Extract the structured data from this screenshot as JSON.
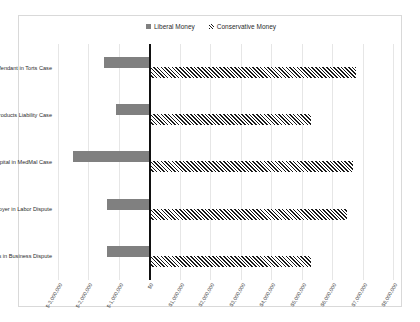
{
  "caption": "",
  "legend": {
    "position": "top-center",
    "items": [
      {
        "label": "Liberal Money",
        "marker": "solid-square-swatch",
        "color": "#808080"
      },
      {
        "label": "Conservative Money",
        "marker": "hatched-square-swatch",
        "color": "#1a1a1a"
      }
    ]
  },
  "chart_data": {
    "type": "bar",
    "orientation": "horizontal",
    "title": "",
    "xlabel": "",
    "ylabel": "",
    "grid": true,
    "legend_position": "top-center",
    "xlim": [
      -3000000,
      8000000
    ],
    "categories": [
      "Defendant in Torts Case",
      "Business in Products Liability Case",
      "Doctor/Hospital in MedMal Case",
      "Employer in Labor Dispute",
      "Business in Business Dispute"
    ],
    "tick_labels": [
      "$-3,000,000",
      "$-2,000,000",
      "$-1,000,000",
      "$0",
      "$1,000,000",
      "$2,000,000",
      "$3,000,000",
      "$4,000,000",
      "$5,000,000",
      "$6,000,000",
      "$7,000,000",
      "$8,000,000"
    ],
    "tick_values": [
      -3000000,
      -2000000,
      -1000000,
      0,
      1000000,
      2000000,
      3000000,
      4000000,
      5000000,
      6000000,
      7000000,
      8000000
    ],
    "series": [
      {
        "name": "Liberal Money",
        "color": "#808080",
        "pattern": "solid",
        "values": [
          -1500000,
          -1100000,
          -2500000,
          -1400000,
          -1400000
        ]
      },
      {
        "name": "Conservative Money",
        "color": "#1a1a1a",
        "pattern": "diagonal-hatch",
        "values": [
          6800000,
          5300000,
          6700000,
          6500000,
          5300000
        ]
      }
    ]
  }
}
